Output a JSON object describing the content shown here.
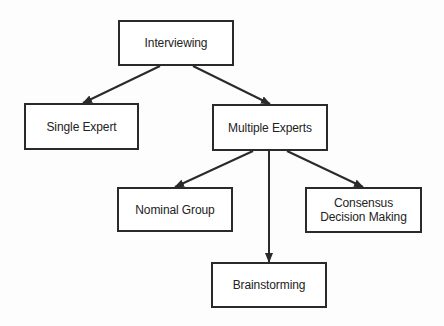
{
  "diagram": {
    "type": "tree",
    "colors": {
      "stroke": "#2a2a2a",
      "text": "#222222",
      "background": "#ffffff"
    },
    "nodes": {
      "interviewing": {
        "label": "Interviewing",
        "x": 118,
        "y": 20,
        "w": 116,
        "h": 46
      },
      "single_expert": {
        "label": "Single Expert",
        "x": 24,
        "y": 103,
        "w": 115,
        "h": 47
      },
      "multiple_experts": {
        "label": "Multiple Experts",
        "x": 212,
        "y": 104,
        "w": 116,
        "h": 47
      },
      "nominal_group": {
        "label": "Nominal Group",
        "x": 117,
        "y": 187,
        "w": 116,
        "h": 45
      },
      "consensus": {
        "label": "Consensus\nDecision Making",
        "x": 305,
        "y": 187,
        "w": 117,
        "h": 46
      },
      "brainstorming": {
        "label": "Brainstorming",
        "x": 211,
        "y": 262,
        "w": 116,
        "h": 46
      }
    },
    "edges": [
      {
        "from": "interviewing",
        "to": "single_expert",
        "x1": 160,
        "y1": 66,
        "x2": 83,
        "y2": 103
      },
      {
        "from": "interviewing",
        "to": "multiple_experts",
        "x1": 193,
        "y1": 66,
        "x2": 270,
        "y2": 104
      },
      {
        "from": "multiple_experts",
        "to": "nominal_group",
        "x1": 253,
        "y1": 151,
        "x2": 175,
        "y2": 187
      },
      {
        "from": "multiple_experts",
        "to": "brainstorming",
        "x1": 269,
        "y1": 151,
        "x2": 269,
        "y2": 262
      },
      {
        "from": "multiple_experts",
        "to": "consensus",
        "x1": 287,
        "y1": 151,
        "x2": 363,
        "y2": 187
      }
    ]
  }
}
